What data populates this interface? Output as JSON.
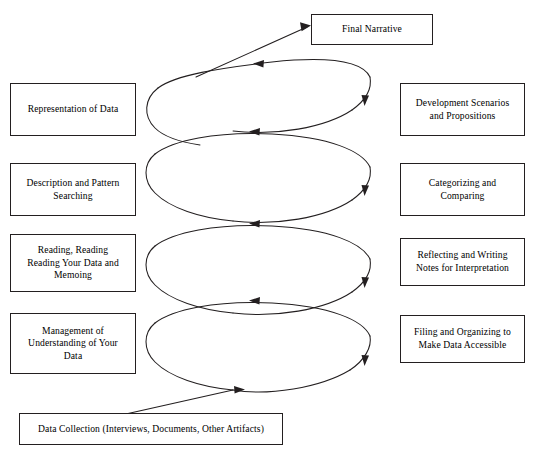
{
  "diagram": {
    "type": "spiral-process-diagram",
    "line_color": "#231f20",
    "background_color": "#ffffff",
    "loop_count": 4,
    "boxes": {
      "final_narrative": "Final Narrative",
      "data_collection": "Data Collection (Interviews, Documents, Other Artifacts)",
      "left": [
        "Representation of Data",
        "Description and Pattern Searching",
        "Reading, Reading Reading Your Data and Memoing",
        "Management of Understanding of Your Data"
      ],
      "right": [
        "Development Scenarios and Propositions",
        "Categorizing and Comparing",
        "Reflecting and Writing Notes for Interpretation",
        "Filing and Organizing to Make Data Accessible"
      ]
    },
    "box_lines": {
      "representation": [
        "Representation of Data"
      ],
      "description": [
        "Description and Pattern",
        "Searching"
      ],
      "reading": [
        "Reading, Reading",
        "Reading Your Data and",
        "Memoing"
      ],
      "management": [
        "Management of",
        "Understanding of Your",
        "Data"
      ],
      "development": [
        "Development Scenarios",
        "and Propositions"
      ],
      "categorizing": [
        "Categorizing and",
        "Comparing"
      ],
      "reflecting": [
        "Reflecting and Writing",
        "Notes for Interpretation"
      ],
      "filing": [
        "Filing and Organizing to",
        "Make Data Accessible"
      ],
      "final_narrative": [
        "Final Narrative"
      ],
      "data_collection": [
        "Data Collection (Interviews, Documents, Other Artifacts)"
      ]
    }
  }
}
